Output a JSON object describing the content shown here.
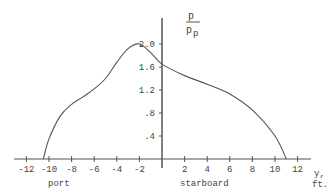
{
  "chart_data": {
    "type": "line",
    "title": "",
    "xlabel": "y, ft.",
    "ylabel": "p / p_p",
    "ylabel_parts": {
      "numerator": "p",
      "denominator": "p",
      "denominator_subscript": "p"
    },
    "xlim": [
      -12,
      12
    ],
    "ylim": [
      0,
      2.0
    ],
    "grid": false,
    "legend": null,
    "x_ticks": [
      -12,
      -10,
      -8,
      -6,
      -4,
      -2,
      2,
      4,
      6,
      8,
      10,
      12
    ],
    "x_tick_labels": [
      "-12",
      "-10",
      "-8",
      "-6",
      "-4",
      "-2",
      "2",
      "4",
      "6",
      "8",
      "10",
      "12"
    ],
    "y_ticks": [
      0.4,
      0.8,
      1.2,
      1.6,
      2.0
    ],
    "y_tick_labels": [
      ".4",
      ".8",
      "1.2",
      "1.6",
      "2.0"
    ],
    "annotations": [
      {
        "text": "port",
        "x": -8,
        "position": "below x-axis"
      },
      {
        "text": "starboard",
        "x": 5,
        "position": "below x-axis"
      }
    ],
    "series": [
      {
        "name": "pressure distribution",
        "x": [
          -10.5,
          -10,
          -9,
          -8,
          -7,
          -6,
          -5,
          -4,
          -3,
          -2,
          -1,
          0,
          2,
          4,
          6,
          8,
          10,
          11
        ],
        "values": [
          0,
          0.35,
          0.75,
          0.95,
          1.08,
          1.22,
          1.4,
          1.68,
          1.92,
          2.0,
          1.85,
          1.65,
          1.45,
          1.3,
          1.13,
          0.85,
          0.4,
          0
        ]
      }
    ]
  },
  "labels": {
    "port": "port",
    "starboard": "starboard",
    "x_unit_line1": "y,",
    "x_unit_line2": "ft.",
    "y_num": "p",
    "y_den": "p",
    "y_den_sub": "p"
  }
}
